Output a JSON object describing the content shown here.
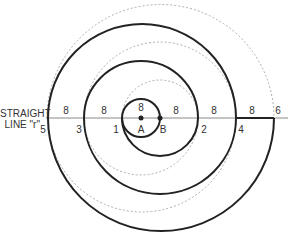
{
  "diagram": {
    "title_line1": "STRAIGHT",
    "title_line2": "LINE \"r\"",
    "points": {
      "A": "A",
      "B": "B"
    },
    "step_labels": [
      "1",
      "2",
      "3",
      "4",
      "5",
      "6"
    ],
    "segment_label": "8",
    "colors": {
      "stroke": "#222222",
      "dashed": "#999999",
      "line": "#888888",
      "text": "#333333"
    }
  }
}
